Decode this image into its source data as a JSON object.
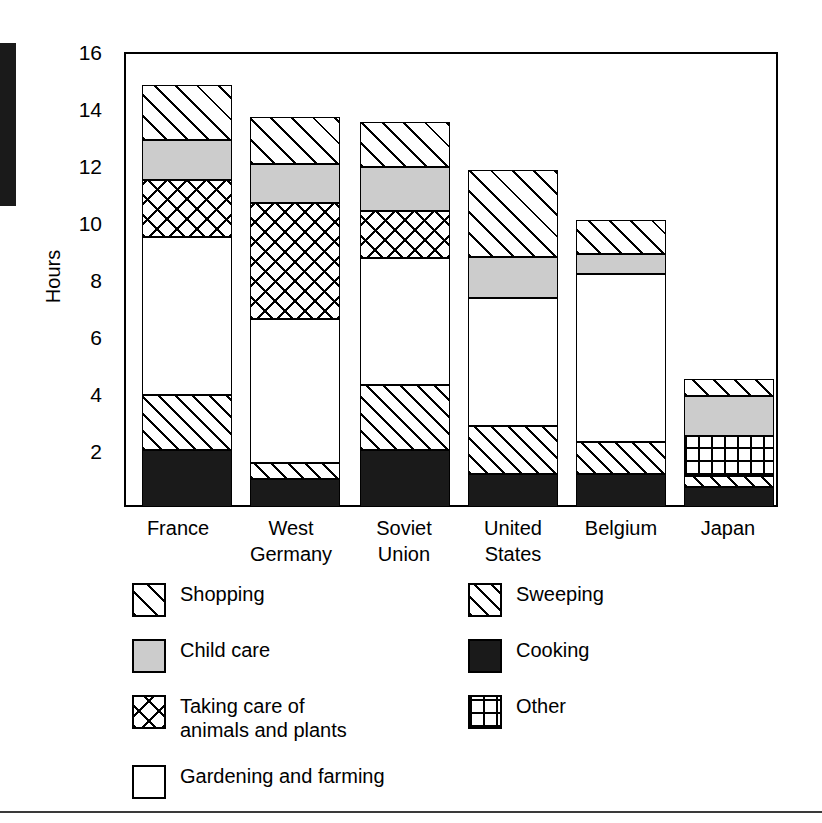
{
  "chart_data": {
    "type": "bar",
    "subtype": "stacked-vertical",
    "title": "",
    "xlabel": "",
    "ylabel": "Hours",
    "ylim": [
      0,
      16
    ],
    "yticks": [
      2,
      4,
      6,
      8,
      10,
      12,
      14,
      16
    ],
    "grid": false,
    "legend_position": "below-plot",
    "categories": [
      "France",
      "West\nGermany",
      "Soviet\nUnion",
      "United\nStates",
      "Belgium",
      "Japan"
    ],
    "category_labels_flat": [
      "France",
      "West Germany",
      "Soviet Union",
      "United States",
      "Belgium",
      "Japan"
    ],
    "stack_order_bottom_to_top": [
      "Cooking",
      "Sweeping",
      "Other",
      "Gardening and farming",
      "Taking care of animals and plants",
      "Child care",
      "Shopping"
    ],
    "series": [
      {
        "name": "Cooking",
        "values": [
          2.0,
          1.0,
          2.0,
          1.15,
          1.15,
          0.7
        ]
      },
      {
        "name": "Sweeping",
        "values": [
          1.95,
          0.55,
          2.3,
          1.7,
          1.15,
          0.4
        ]
      },
      {
        "name": "Other",
        "values": [
          0.0,
          0.0,
          0.0,
          0.0,
          0.0,
          1.4
        ]
      },
      {
        "name": "Gardening and farming",
        "values": [
          5.55,
          5.05,
          4.45,
          4.5,
          5.9,
          0.0
        ]
      },
      {
        "name": "Taking care of animals and plants",
        "values": [
          2.0,
          4.1,
          1.65,
          0.0,
          0.0,
          0.0
        ]
      },
      {
        "name": "Child care",
        "values": [
          1.4,
          1.35,
          1.55,
          1.45,
          0.7,
          1.4
        ]
      },
      {
        "name": "Shopping",
        "values": [
          1.95,
          1.65,
          1.6,
          3.05,
          1.2,
          0.6
        ]
      }
    ],
    "totals": [
      14.85,
      13.7,
      13.55,
      11.85,
      10.1,
      4.5
    ]
  },
  "axis": {
    "y_label": "Hours",
    "y_tick_labels": [
      "16",
      "14",
      "12",
      "10",
      "8",
      "6",
      "4",
      "2"
    ],
    "x_tick_labels": [
      {
        "line1": "France",
        "line2": ""
      },
      {
        "line1": "West",
        "line2": "Germany"
      },
      {
        "line1": "Soviet",
        "line2": "Union"
      },
      {
        "line1": "United",
        "line2": "States"
      },
      {
        "line1": "Belgium",
        "line2": ""
      },
      {
        "line1": "Japan",
        "line2": ""
      }
    ]
  },
  "legend": {
    "left_column": [
      {
        "label": "Shopping",
        "pattern": "diagonal-hatch-wide",
        "swatch_icon": "shopping-swatch-icon"
      },
      {
        "label": "Child care",
        "pattern": "solid-grey",
        "swatch_icon": "child-care-swatch-icon",
        "color": "#cccccc"
      },
      {
        "label": "Taking care of\nanimals and plants",
        "pattern": "cross-hatch",
        "swatch_icon": "taking-care-swatch-icon"
      },
      {
        "label": "Gardening and farming",
        "pattern": "plain-white",
        "swatch_icon": "gardening-swatch-icon",
        "color": "#ffffff"
      }
    ],
    "right_column": [
      {
        "label": "Sweeping",
        "pattern": "diagonal-hatch-tight",
        "swatch_icon": "sweeping-swatch-icon"
      },
      {
        "label": "Cooking",
        "pattern": "solid-black",
        "swatch_icon": "cooking-swatch-icon",
        "color": "#1a1a1a"
      },
      {
        "label": "Other",
        "pattern": "square-grid",
        "swatch_icon": "other-swatch-icon"
      }
    ]
  },
  "colors": {
    "line": "#000000",
    "background": "#ffffff",
    "cooking": "#1a1a1a",
    "child_care": "#cccccc",
    "gardening": "#ffffff"
  }
}
